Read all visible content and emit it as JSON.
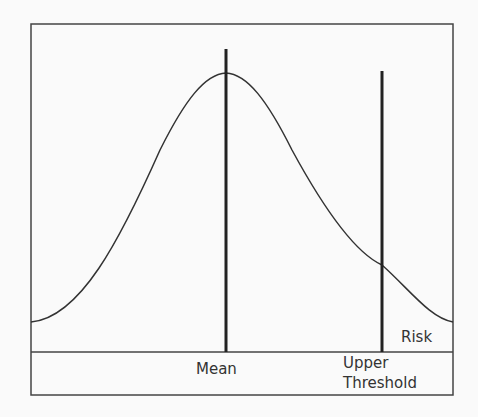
{
  "figure": {
    "labels": {
      "mean": "Mean",
      "upper_threshold_line1": "Upper",
      "upper_threshold_line2": "Threshold",
      "risk": "Risk"
    },
    "elements": [
      "normal-distribution-curve",
      "mean-line",
      "upper-threshold-line",
      "risk-region"
    ]
  }
}
